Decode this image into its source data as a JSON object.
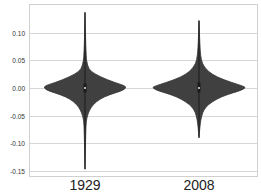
{
  "chart_data": {
    "type": "violin",
    "title": "",
    "xlabel": "",
    "ylabel": "",
    "categories": [
      "1929",
      "2008"
    ],
    "ylim": [
      -0.16,
      0.14
    ],
    "yticks": [
      0.1,
      0.05,
      0.0,
      -0.05,
      -0.1,
      -0.15
    ],
    "ytick_labels": [
      "0.10",
      "0.05",
      "0.00",
      "-0.05",
      "-0.10",
      "-0.15"
    ],
    "grid": true,
    "legend": null,
    "series": [
      {
        "name": "1929",
        "min": -0.147,
        "max": 0.137,
        "median": 0.0,
        "q1": -0.008,
        "q3": 0.008,
        "max_halfwidth_at": 0.0,
        "profile": [
          [
            0.137,
            0.0
          ],
          [
            0.06,
            0.02
          ],
          [
            0.04,
            0.06
          ],
          [
            0.03,
            0.14
          ],
          [
            0.02,
            0.38
          ],
          [
            0.01,
            0.72
          ],
          [
            0.004,
            0.98
          ],
          [
            0.0,
            1.0
          ],
          [
            -0.005,
            0.9
          ],
          [
            -0.012,
            0.6
          ],
          [
            -0.02,
            0.36
          ],
          [
            -0.03,
            0.2
          ],
          [
            -0.04,
            0.11
          ],
          [
            -0.05,
            0.06
          ],
          [
            -0.06,
            0.03
          ],
          [
            -0.08,
            0.018
          ],
          [
            -0.147,
            0.0
          ]
        ]
      },
      {
        "name": "2008",
        "min": -0.09,
        "max": 0.122,
        "median": 0.0,
        "q1": -0.008,
        "q3": 0.01,
        "max_halfwidth_at": 0.0,
        "profile": [
          [
            0.122,
            0.0
          ],
          [
            0.07,
            0.02
          ],
          [
            0.05,
            0.05
          ],
          [
            0.04,
            0.1
          ],
          [
            0.03,
            0.2
          ],
          [
            0.02,
            0.38
          ],
          [
            0.01,
            0.7
          ],
          [
            0.003,
            0.97
          ],
          [
            0.0,
            1.0
          ],
          [
            -0.005,
            0.88
          ],
          [
            -0.012,
            0.6
          ],
          [
            -0.02,
            0.38
          ],
          [
            -0.03,
            0.2
          ],
          [
            -0.04,
            0.1
          ],
          [
            -0.05,
            0.06
          ],
          [
            -0.06,
            0.035
          ],
          [
            -0.07,
            0.02
          ],
          [
            -0.09,
            0.0
          ]
        ]
      }
    ]
  },
  "style": {
    "violin_fill": "#404040",
    "violin_stroke": "#303030",
    "inner_box": "#1a1a1a",
    "median_marker": "#ffffff",
    "grid_color": "#d6d6d6",
    "frame_color": "#d0d0d0",
    "background": "#ffffff"
  },
  "layout": {
    "plot_left": 29,
    "plot_top": 4,
    "plot_right": 257,
    "plot_bottom": 176,
    "y_zero_px": 88,
    "px_per_unit": 552,
    "x_centers": [
      85,
      199
    ],
    "max_halfwidths": [
      41,
      46.5
    ]
  }
}
